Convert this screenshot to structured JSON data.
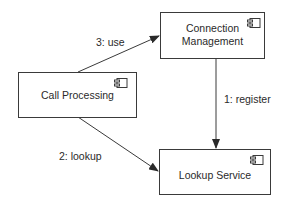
{
  "diagram": {
    "type": "UML component / communication diagram",
    "nodes": [
      {
        "id": "connection-management",
        "label_line1": "Connection",
        "label_line2": "Management",
        "stereotype_icon": "component-icon"
      },
      {
        "id": "call-processing",
        "label": "Call Processing",
        "stereotype_icon": "component-icon"
      },
      {
        "id": "lookup-service",
        "label": "Lookup Service",
        "stereotype_icon": "component-icon"
      }
    ],
    "edges": [
      {
        "from": "connection-management",
        "to": "lookup-service",
        "label": "1: register"
      },
      {
        "from": "call-processing",
        "to": "lookup-service",
        "label": "2: lookup"
      },
      {
        "from": "call-processing",
        "to": "connection-management",
        "label": "3: use"
      }
    ],
    "colors": {
      "line": "#3a3a3a",
      "text": "#2a2a2a",
      "background": "#ffffff"
    }
  }
}
